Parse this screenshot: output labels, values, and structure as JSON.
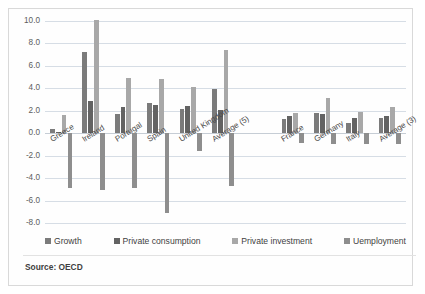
{
  "chart_data": {
    "type": "bar",
    "title": "",
    "xlabel": "",
    "ylabel": "",
    "ylim": [
      -8.0,
      10.0
    ],
    "ytick_step": 2.0,
    "grid": true,
    "legend_position": "bottom",
    "ytick_labels": [
      "10.0",
      "8.0",
      "6.0",
      "4.0",
      "2.0",
      "0.0",
      "-2.0",
      "-4.0",
      "-6.0",
      "-8.0"
    ],
    "categories": [
      "Greece",
      "Ireland",
      "Portugal",
      "Spain",
      "United Kingdom",
      "Average (5)",
      "France",
      "Germany",
      "Italy",
      "Average (3)"
    ],
    "group_break_after": "Average (5)",
    "series": [
      {
        "name": "Growth",
        "color": "#7b7b7b",
        "values": [
          0.4,
          7.2,
          1.7,
          2.7,
          2.2,
          3.9,
          1.3,
          1.8,
          0.9,
          1.4
        ]
      },
      {
        "name": "Private consumption",
        "color": "#636363",
        "values": [
          0.1,
          2.9,
          2.3,
          2.5,
          2.4,
          2.1,
          1.5,
          1.7,
          1.4,
          1.5
        ]
      },
      {
        "name": "Private investment",
        "color": "#a8a8a8",
        "values": [
          1.6,
          10.1,
          4.9,
          4.8,
          4.1,
          7.4,
          1.8,
          3.1,
          1.9,
          2.3
        ]
      },
      {
        "name": "Uemployment",
        "color": "#8e8e8e",
        "values": [
          -4.9,
          -5.1,
          -4.9,
          -7.1,
          -1.6,
          -4.7,
          -0.9,
          -1.0,
          -1.0,
          -1.0
        ]
      }
    ]
  },
  "footer": {
    "source": "Source: OECD"
  }
}
